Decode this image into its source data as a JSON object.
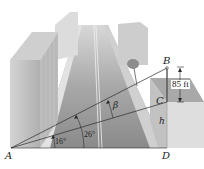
{
  "diagram": {
    "points": {
      "A": "A",
      "B": "B",
      "C": "C",
      "D": "D"
    },
    "labels": {
      "height_label": "h",
      "segment_BC": "85 ft",
      "angle_beta": "β",
      "angle_large": "26°",
      "angle_small": "16°"
    },
    "colors": {
      "line": "#2a2a2a",
      "road": "#8f8f8f",
      "building": "#c8c8c8"
    }
  }
}
